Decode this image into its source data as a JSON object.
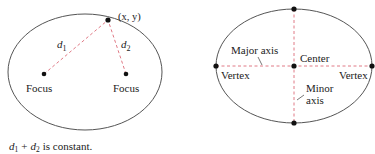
{
  "colors": {
    "curve": "#555555",
    "dash": "#e07a86",
    "point": "#111111",
    "text": "#222222"
  },
  "left_figure": {
    "point_label": "(x, y)",
    "d1": {
      "base": "d",
      "sub": "1"
    },
    "d2": {
      "base": "d",
      "sub": "2"
    },
    "focus_left_label": "Focus",
    "focus_right_label": "Focus"
  },
  "right_figure": {
    "major_axis_label": "Major axis",
    "center_label": "Center",
    "vertex_left_label": "Vertex",
    "vertex_right_label": "Vertex",
    "minor_axis_label_line1": "Minor",
    "minor_axis_label_line2": "axis"
  },
  "caption": {
    "d1": "d",
    "d1_sub": "1",
    "plus": "+",
    "d2": "d",
    "d2_sub": "2",
    "rest": "is constant."
  }
}
